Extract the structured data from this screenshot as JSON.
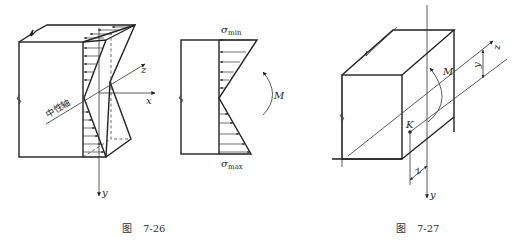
{
  "figures": [
    {
      "id": "fig-7-26",
      "caption_prefix": "图",
      "caption_number": "7-26",
      "labels": {
        "neutral_axis": "中性轴",
        "x_axis": "x",
        "y_axis": "y",
        "z_axis": "z"
      }
    },
    {
      "id": "fig-7-26-side",
      "labels": {
        "sigma": "σ",
        "sigma_min_sub": "min",
        "sigma_max_sub": "max",
        "moment": "M"
      }
    },
    {
      "id": "fig-7-27",
      "caption_prefix": "图",
      "caption_number": "7-27",
      "labels": {
        "moment": "M",
        "point": "K",
        "y_axis": "y",
        "z_axis": "z",
        "y_dim": "y",
        "z_dim": "z"
      }
    }
  ],
  "colors": {
    "line": "#222222",
    "background": "#ffffff"
  }
}
